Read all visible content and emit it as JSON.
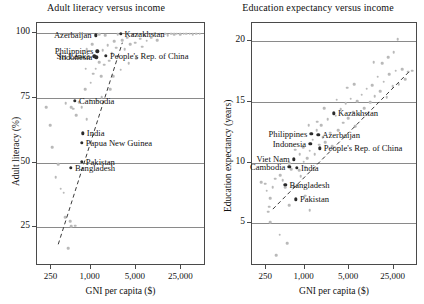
{
  "figure": {
    "width": 424,
    "height": 304,
    "background": "#ffffff",
    "point_color": "#b9b9b9",
    "highlight_color": "#2b2b2b",
    "axis_color": "#4a4a4a",
    "grid_color": "#8a8a8a"
  },
  "chart_data": [
    {
      "type": "scatter",
      "title": "Adult literacy versus income",
      "xlabel": "GNI per capita ($)",
      "ylabel": "Adult literacy (%)",
      "xscale": "log",
      "xlim": [
        150,
        60000
      ],
      "ylim": [
        10,
        104
      ],
      "xticks": [
        250,
        1000,
        5000,
        25000
      ],
      "xticklabels": [
        "250",
        "1,000",
        "5,000",
        "25,000"
      ],
      "yticks": [
        25,
        50,
        75,
        100
      ],
      "yticklabels": [
        "25",
        "50",
        "75",
        "100"
      ],
      "grid": "horizontal",
      "legend": "none",
      "trendline": {
        "type": "dashed",
        "x": [
          330,
          3200
        ],
        "y": [
          18,
          96
        ]
      },
      "labeled_points": [
        {
          "name": "Azerbaijan",
          "x": 1240,
          "y": 98.8,
          "label_side": "left"
        },
        {
          "name": "Kazakhstan",
          "x": 3000,
          "y": 99.5,
          "label_side": "right"
        },
        {
          "name": "Philippines",
          "x": 1320,
          "y": 92.6,
          "label_side": "left"
        },
        {
          "name": "People's Rep. of China",
          "x": 1800,
          "y": 91.0,
          "label_side": "right"
        },
        {
          "name": "Indonesia",
          "x": 1270,
          "y": 90.4,
          "label_side": "left"
        },
        {
          "name": "Sri Lanka",
          "x": 1180,
          "y": 90.7,
          "label_side": "left"
        },
        {
          "name": "Cambodia",
          "x": 600,
          "y": 73.6,
          "label_side": "right"
        },
        {
          "name": "India",
          "x": 790,
          "y": 61.0,
          "label_side": "right"
        },
        {
          "name": "Papua New Guinea",
          "x": 760,
          "y": 57.3,
          "label_side": "right"
        },
        {
          "name": "Pakistan",
          "x": 760,
          "y": 49.9,
          "label_side": "right"
        },
        {
          "name": "Bangladesh",
          "x": 520,
          "y": 47.5,
          "label_side": "right"
        }
      ],
      "background_points": [
        {
          "x": 215,
          "y": 71.0
        },
        {
          "x": 250,
          "y": 64.0
        },
        {
          "x": 265,
          "y": 55.5
        },
        {
          "x": 300,
          "y": 44.0
        },
        {
          "x": 330,
          "y": 49.0
        },
        {
          "x": 360,
          "y": 39.5
        },
        {
          "x": 400,
          "y": 38.0
        },
        {
          "x": 420,
          "y": 28.5
        },
        {
          "x": 500,
          "y": 27.0
        },
        {
          "x": 520,
          "y": 25.0
        },
        {
          "x": 600,
          "y": 25.2
        },
        {
          "x": 470,
          "y": 16.5
        },
        {
          "x": 430,
          "y": 72.5
        },
        {
          "x": 520,
          "y": 71.0
        },
        {
          "x": 560,
          "y": 70.5
        },
        {
          "x": 620,
          "y": 68.0
        },
        {
          "x": 700,
          "y": 73.0
        },
        {
          "x": 760,
          "y": 71.0
        },
        {
          "x": 850,
          "y": 78.0
        },
        {
          "x": 900,
          "y": 66.5
        },
        {
          "x": 1000,
          "y": 74.0
        },
        {
          "x": 1050,
          "y": 80.5
        },
        {
          "x": 1150,
          "y": 84.0
        },
        {
          "x": 1250,
          "y": 86.0
        },
        {
          "x": 1400,
          "y": 88.5
        },
        {
          "x": 1500,
          "y": 83.0
        },
        {
          "x": 1600,
          "y": 93.0
        },
        {
          "x": 1700,
          "y": 87.5
        },
        {
          "x": 1900,
          "y": 95.0
        },
        {
          "x": 2000,
          "y": 89.0
        },
        {
          "x": 2200,
          "y": 92.0
        },
        {
          "x": 2400,
          "y": 96.5
        },
        {
          "x": 2600,
          "y": 94.0
        },
        {
          "x": 2800,
          "y": 90.5
        },
        {
          "x": 3200,
          "y": 97.0
        },
        {
          "x": 3500,
          "y": 93.5
        },
        {
          "x": 3800,
          "y": 98.0
        },
        {
          "x": 4200,
          "y": 95.5
        },
        {
          "x": 4600,
          "y": 99.0
        },
        {
          "x": 5000,
          "y": 96.0
        },
        {
          "x": 5500,
          "y": 99.3
        },
        {
          "x": 6000,
          "y": 97.5
        },
        {
          "x": 6500,
          "y": 94.5
        },
        {
          "x": 7000,
          "y": 99.0
        },
        {
          "x": 7600,
          "y": 96.8
        },
        {
          "x": 8200,
          "y": 99.4
        },
        {
          "x": 9000,
          "y": 98.0
        },
        {
          "x": 9800,
          "y": 99.2
        },
        {
          "x": 11000,
          "y": 97.0
        },
        {
          "x": 12000,
          "y": 99.5
        },
        {
          "x": 13000,
          "y": 98.3
        },
        {
          "x": 14500,
          "y": 99.4
        },
        {
          "x": 16000,
          "y": 99.0
        },
        {
          "x": 18000,
          "y": 99.5
        },
        {
          "x": 20000,
          "y": 99.2
        },
        {
          "x": 22000,
          "y": 99.5
        },
        {
          "x": 25000,
          "y": 99.3
        },
        {
          "x": 28000,
          "y": 99.5
        },
        {
          "x": 31000,
          "y": 99.4
        },
        {
          "x": 35000,
          "y": 99.5
        },
        {
          "x": 39000,
          "y": 99.3
        },
        {
          "x": 44000,
          "y": 99.5
        },
        {
          "x": 50000,
          "y": 99.4
        },
        {
          "x": 2300,
          "y": 83.0
        },
        {
          "x": 3000,
          "y": 85.5
        },
        {
          "x": 4000,
          "y": 88.0
        },
        {
          "x": 5200,
          "y": 90.0
        },
        {
          "x": 2700,
          "y": 99.2
        },
        {
          "x": 1750,
          "y": 99.0
        },
        {
          "x": 1400,
          "y": 99.3
        },
        {
          "x": 3600,
          "y": 99.4
        },
        {
          "x": 6800,
          "y": 99.3
        },
        {
          "x": 900,
          "y": 93.5
        },
        {
          "x": 1100,
          "y": 95.5
        },
        {
          "x": 2100,
          "y": 78.0
        },
        {
          "x": 1300,
          "y": 73.5
        },
        {
          "x": 1550,
          "y": 75.0
        },
        {
          "x": 870,
          "y": 86.0
        }
      ]
    },
    {
      "type": "scatter",
      "title": "Education expectancy versus income",
      "xlabel": "GNI per capita ($)",
      "ylabel": "Education expectancy (years)",
      "xscale": "log",
      "xlim": [
        150,
        60000
      ],
      "ylim": [
        1.5,
        21.5
      ],
      "xticks": [
        250,
        1000,
        5000,
        25000
      ],
      "xticklabels": [
        "250",
        "1,000",
        "5,000",
        "25,000"
      ],
      "yticks": [
        5,
        10,
        15,
        20
      ],
      "yticklabels": [
        "5",
        "10",
        "15",
        "20"
      ],
      "grid": "horizontal",
      "legend": "none",
      "trendline": {
        "type": "dashed",
        "x": [
          330,
          45000
        ],
        "y": [
          6.1,
          17.4
        ]
      },
      "labeled_points": [
        {
          "name": "Kazakhstan",
          "x": 3000,
          "y": 14.0,
          "label_side": "right"
        },
        {
          "name": "Philippines",
          "x": 1320,
          "y": 12.3,
          "label_side": "left"
        },
        {
          "name": "Azerbaijan",
          "x": 1700,
          "y": 12.2,
          "label_side": "right"
        },
        {
          "name": "Indonesia",
          "x": 1270,
          "y": 11.5,
          "label_side": "left"
        },
        {
          "name": "People's Rep. of China",
          "x": 1800,
          "y": 11.1,
          "label_side": "right"
        },
        {
          "name": "Viet Nam",
          "x": 700,
          "y": 10.2,
          "label_side": "left"
        },
        {
          "name": "Cambodia",
          "x": 600,
          "y": 9.6,
          "label_side": "left"
        },
        {
          "name": "India",
          "x": 790,
          "y": 9.5,
          "label_side": "right"
        },
        {
          "name": "Bangladesh",
          "x": 520,
          "y": 8.1,
          "label_side": "right"
        },
        {
          "name": "Pakistan",
          "x": 760,
          "y": 6.9,
          "label_side": "right"
        }
      ],
      "background_points": [
        {
          "x": 215,
          "y": 8.3
        },
        {
          "x": 250,
          "y": 8.2
        },
        {
          "x": 265,
          "y": 7.6
        },
        {
          "x": 300,
          "y": 7.0
        },
        {
          "x": 330,
          "y": 7.9
        },
        {
          "x": 360,
          "y": 8.6
        },
        {
          "x": 290,
          "y": 6.3
        },
        {
          "x": 280,
          "y": 5.9
        },
        {
          "x": 300,
          "y": 5.0
        },
        {
          "x": 420,
          "y": 4.0
        },
        {
          "x": 560,
          "y": 3.3
        },
        {
          "x": 370,
          "y": 2.3
        },
        {
          "x": 430,
          "y": 8.9
        },
        {
          "x": 470,
          "y": 8.5
        },
        {
          "x": 520,
          "y": 7.9
        },
        {
          "x": 600,
          "y": 6.4
        },
        {
          "x": 640,
          "y": 9.4
        },
        {
          "x": 700,
          "y": 8.0
        },
        {
          "x": 780,
          "y": 8.0
        },
        {
          "x": 860,
          "y": 9.3
        },
        {
          "x": 900,
          "y": 8.8
        },
        {
          "x": 1000,
          "y": 10.0
        },
        {
          "x": 1050,
          "y": 9.6
        },
        {
          "x": 1150,
          "y": 10.3
        },
        {
          "x": 1250,
          "y": 10.9
        },
        {
          "x": 1400,
          "y": 11.8
        },
        {
          "x": 1500,
          "y": 10.6
        },
        {
          "x": 1600,
          "y": 12.6
        },
        {
          "x": 1750,
          "y": 11.4
        },
        {
          "x": 1900,
          "y": 13.0
        },
        {
          "x": 2000,
          "y": 12.0
        },
        {
          "x": 2200,
          "y": 11.6
        },
        {
          "x": 2400,
          "y": 13.5
        },
        {
          "x": 2600,
          "y": 12.4
        },
        {
          "x": 2800,
          "y": 11.3
        },
        {
          "x": 3200,
          "y": 13.8
        },
        {
          "x": 3500,
          "y": 12.6
        },
        {
          "x": 3800,
          "y": 14.3
        },
        {
          "x": 4200,
          "y": 13.2
        },
        {
          "x": 4600,
          "y": 14.8
        },
        {
          "x": 5000,
          "y": 13.6
        },
        {
          "x": 5500,
          "y": 15.2
        },
        {
          "x": 6000,
          "y": 14.1
        },
        {
          "x": 6500,
          "y": 12.9
        },
        {
          "x": 7000,
          "y": 15.0
        },
        {
          "x": 7600,
          "y": 13.9
        },
        {
          "x": 8200,
          "y": 15.5
        },
        {
          "x": 9000,
          "y": 14.4
        },
        {
          "x": 9800,
          "y": 16.0
        },
        {
          "x": 11000,
          "y": 14.9
        },
        {
          "x": 12000,
          "y": 16.3
        },
        {
          "x": 13000,
          "y": 15.4
        },
        {
          "x": 14500,
          "y": 17.0
        },
        {
          "x": 16000,
          "y": 15.8
        },
        {
          "x": 18000,
          "y": 16.6
        },
        {
          "x": 20000,
          "y": 15.3
        },
        {
          "x": 22000,
          "y": 17.2
        },
        {
          "x": 25000,
          "y": 16.2
        },
        {
          "x": 28000,
          "y": 17.5
        },
        {
          "x": 31000,
          "y": 16.4
        },
        {
          "x": 35000,
          "y": 17.6
        },
        {
          "x": 39000,
          "y": 16.8
        },
        {
          "x": 44000,
          "y": 17.4
        },
        {
          "x": 50000,
          "y": 17.5
        },
        {
          "x": 30000,
          "y": 20.1
        },
        {
          "x": 21000,
          "y": 18.6
        },
        {
          "x": 17000,
          "y": 18.1
        },
        {
          "x": 12500,
          "y": 18.2
        },
        {
          "x": 26000,
          "y": 19.0
        },
        {
          "x": 2100,
          "y": 14.4
        },
        {
          "x": 1200,
          "y": 13.0
        },
        {
          "x": 1650,
          "y": 13.3
        },
        {
          "x": 980,
          "y": 11.2
        },
        {
          "x": 870,
          "y": 10.6
        },
        {
          "x": 740,
          "y": 11.0
        },
        {
          "x": 3300,
          "y": 15.1
        },
        {
          "x": 4800,
          "y": 16.1
        },
        {
          "x": 6200,
          "y": 16.4
        },
        {
          "x": 1050,
          "y": 7.2
        },
        {
          "x": 1250,
          "y": 6.0
        },
        {
          "x": 600,
          "y": 9.9
        }
      ]
    }
  ]
}
